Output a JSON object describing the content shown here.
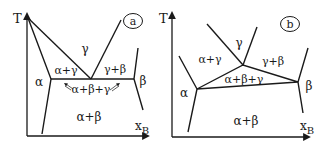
{
  "figure": {
    "panels": [
      {
        "id": "a",
        "badge": "a",
        "axis_y_label": "T",
        "axis_x_label": "x",
        "axis_x_subscript": "B",
        "regions": {
          "alpha": "α",
          "gamma": "γ",
          "alpha_gamma": "α+γ",
          "gamma_beta": "γ+β",
          "beta": "β",
          "alpha_beta_gamma": "α+β+γ",
          "alpha_beta": "α+β"
        },
        "description": "Eutectic-type invariant: three-phase reaction line α+β+γ horizontal"
      },
      {
        "id": "b",
        "badge": "b",
        "axis_y_label": "T",
        "axis_x_label": "x",
        "axis_x_subscript": "B",
        "regions": {
          "alpha": "α",
          "gamma": "γ",
          "alpha_gamma": "α+γ",
          "gamma_beta": "γ+β",
          "beta": "β",
          "alpha_beta_gamma": "α+β+γ",
          "alpha_beta": "α+β"
        },
        "description": "Three-phase field α+β+γ as a triangle"
      }
    ]
  }
}
